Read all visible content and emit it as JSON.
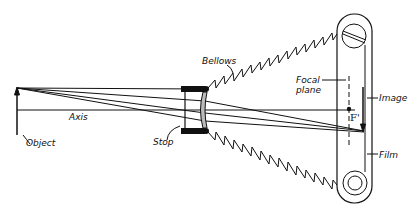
{
  "diagram": {
    "labels": {
      "bellows": "Bellows",
      "focal_plane_1": "Focal",
      "focal_plane_2": "plane",
      "image": "Image",
      "axis": "Axis",
      "object": "Object",
      "stop": "Stop",
      "focal_point": "F'",
      "film": "Film"
    },
    "components": [
      "Object",
      "Axis",
      "Stop",
      "Lens",
      "Bellows",
      "Focal plane",
      "F'",
      "Image",
      "Film",
      "Film rollers"
    ],
    "colors": {
      "ink": "#111111",
      "lens_fill": "#bbbbbb",
      "background": "#ffffff"
    }
  }
}
